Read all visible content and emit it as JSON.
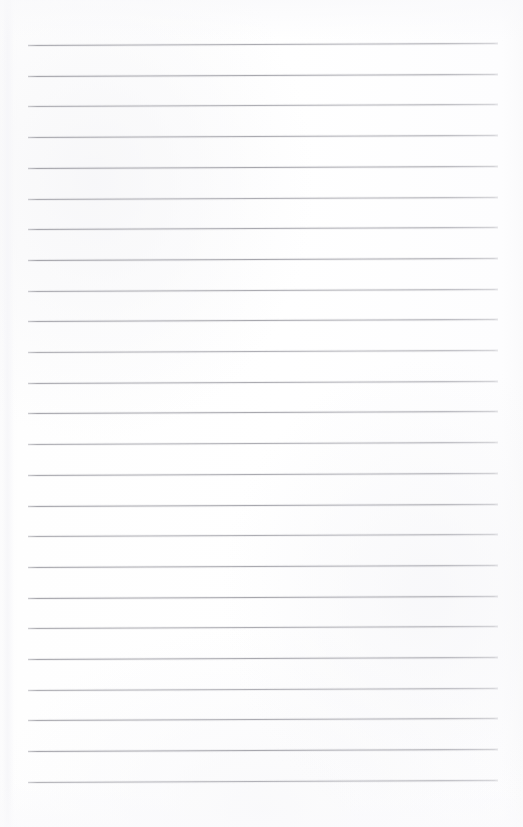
{
  "document": {
    "kind": "scanned-blank-ruled-page",
    "title": "Blank Ruled Notebook Page",
    "page_width": 523,
    "page_height": 827,
    "paper_color": "#fdfdfd",
    "rule_color": "#9a9aa1",
    "has_text_content": false,
    "written_content": "",
    "margin_rule": false,
    "header_text": "",
    "footer_text": "",
    "page_number": ""
  },
  "ruling": {
    "line_count": 25,
    "first_line_y": 45,
    "line_spacing": 30.7,
    "line_left_x": 28,
    "line_right_x": 498,
    "line_thickness": 1,
    "tilt_px": -2,
    "lines": [
      {
        "index": 1,
        "y": 45.0
      },
      {
        "index": 2,
        "y": 75.7
      },
      {
        "index": 3,
        "y": 106.4
      },
      {
        "index": 4,
        "y": 137.1
      },
      {
        "index": 5,
        "y": 167.8
      },
      {
        "index": 6,
        "y": 198.5
      },
      {
        "index": 7,
        "y": 229.2
      },
      {
        "index": 8,
        "y": 259.9
      },
      {
        "index": 9,
        "y": 290.6
      },
      {
        "index": 10,
        "y": 321.3
      },
      {
        "index": 11,
        "y": 352.0
      },
      {
        "index": 12,
        "y": 382.7
      },
      {
        "index": 13,
        "y": 413.4
      },
      {
        "index": 14,
        "y": 444.1
      },
      {
        "index": 15,
        "y": 474.8
      },
      {
        "index": 16,
        "y": 505.5
      },
      {
        "index": 17,
        "y": 536.2
      },
      {
        "index": 18,
        "y": 566.9
      },
      {
        "index": 19,
        "y": 597.6
      },
      {
        "index": 20,
        "y": 628.3
      },
      {
        "index": 21,
        "y": 659.0
      },
      {
        "index": 22,
        "y": 689.7
      },
      {
        "index": 23,
        "y": 720.4
      },
      {
        "index": 24,
        "y": 751.1
      },
      {
        "index": 25,
        "y": 781.8
      }
    ]
  }
}
